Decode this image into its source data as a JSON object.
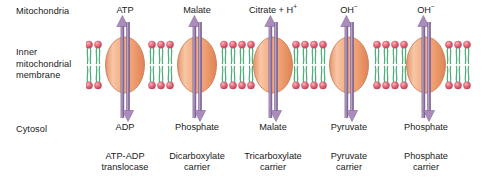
{
  "figure": {
    "width": 483,
    "height": 185
  },
  "regions": {
    "top_label": "Mitochondria",
    "membrane_label": "Inner\nmitochondrial\nmembrane",
    "bottom_label": "Cytosol"
  },
  "colors": {
    "protein_fill_light": "#f7c5a4",
    "protein_fill_mid": "#f0a276",
    "protein_fill_dark": "#e08b5e",
    "protein_outline": "#c9744a",
    "arrow_purple": "#8d6e9e",
    "arrow_purple_dark": "#6f5383",
    "lipid_head": "#e8707f",
    "lipid_head_dark": "#c8485c",
    "lipid_tail": "#4fae7a",
    "text": "#1a1a1a",
    "background": "#ffffff"
  },
  "membrane": {
    "name": "inner mitochondrial membrane",
    "type": "phospholipid bilayer",
    "left": 86,
    "top": 40,
    "width": 389,
    "height": 50
  },
  "transporters": [
    {
      "id": "atp-adp-translocase",
      "center_x": 125,
      "carrier_name": "ATP-ADP\ntranslocase",
      "matrix_substrate": "ATP",
      "matrix_substrate_sup": "",
      "cytosol_substrate": "ADP",
      "arrow_up_direction": "up",
      "arrow_down_direction": "down"
    },
    {
      "id": "dicarboxylate-carrier",
      "center_x": 197,
      "carrier_name": "Dicarboxylate\ncarrier",
      "matrix_substrate": "Malate",
      "matrix_substrate_sup": "",
      "cytosol_substrate": "Phosphate",
      "arrow_up_direction": "up",
      "arrow_down_direction": "down"
    },
    {
      "id": "tricarboxylate-carrier",
      "center_x": 273,
      "carrier_name": "Tricarboxylate\ncarrier",
      "matrix_substrate": "Citrate + H",
      "matrix_substrate_sup": "+",
      "cytosol_substrate": "Malate",
      "arrow_up_direction": "up",
      "arrow_down_direction": "down"
    },
    {
      "id": "pyruvate-carrier",
      "center_x": 349,
      "carrier_name": "Pyruvate\ncarrier",
      "matrix_substrate": "OH",
      "matrix_substrate_sup": "−",
      "cytosol_substrate": "Pyruvate",
      "arrow_up_direction": "up",
      "arrow_down_direction": "down"
    },
    {
      "id": "phosphate-carrier",
      "center_x": 426,
      "carrier_name": "Phosphate\ncarrier",
      "matrix_substrate": "OH",
      "matrix_substrate_sup": "−",
      "cytosol_substrate": "Phosphate",
      "arrow_up_direction": "up",
      "arrow_down_direction": "down"
    }
  ]
}
